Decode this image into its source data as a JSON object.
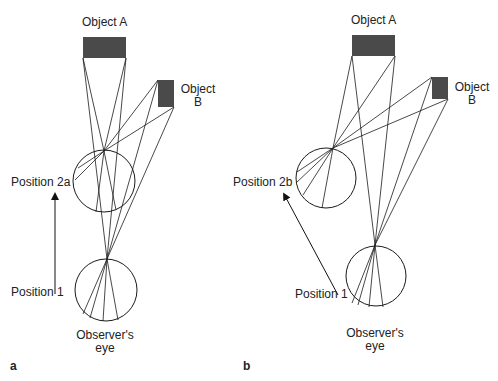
{
  "panels": [
    {
      "id": "a",
      "letter": "a",
      "object_a": {
        "label": "Object A",
        "rect": [
          83,
          37,
          43,
          21
        ]
      },
      "object_b": {
        "label_line1": "Object",
        "label_line2": "B",
        "rect": [
          158,
          80,
          16,
          27
        ]
      },
      "position2": {
        "label": "Position 2a",
        "center": [
          104,
          181
        ],
        "r": 31,
        "focus": [
          104,
          151
        ]
      },
      "position1": {
        "label": "Position 1",
        "center": [
          106,
          290
        ],
        "r": 31,
        "focus": [
          107,
          259
        ]
      },
      "eye_label_line1": "Observer's",
      "eye_label_line2": "eye",
      "arrow": {
        "from": [
          55,
          294
        ],
        "to": [
          55,
          196
        ]
      },
      "rays_pos2": [
        [
          [
            83,
            58
          ],
          [
            104,
            151
          ],
          [
            96,
            212
          ]
        ],
        [
          [
            126,
            58
          ],
          [
            104,
            151
          ],
          [
            116,
            210
          ]
        ],
        [
          [
            158,
            80
          ],
          [
            104,
            151
          ],
          [
            75,
            180
          ]
        ],
        [
          [
            174,
            107
          ],
          [
            104,
            151
          ],
          [
            78,
            168
          ]
        ]
      ],
      "rays_pos1": [
        [
          [
            158,
            80
          ],
          [
            107,
            259
          ],
          [
            90,
            318
          ]
        ],
        [
          [
            174,
            107
          ],
          [
            107,
            259
          ],
          [
            83,
            314
          ]
        ],
        [
          [
            83,
            58
          ],
          [
            107,
            259
          ],
          [
            118,
            320
          ]
        ],
        [
          [
            126,
            58
          ],
          [
            107,
            259
          ],
          [
            103,
            321
          ]
        ]
      ]
    },
    {
      "id": "b",
      "letter": "b",
      "object_a": {
        "label": "Object A",
        "rect": [
          352,
          35,
          43,
          21
        ]
      },
      "object_b": {
        "label_line1": "Object",
        "label_line2": "B",
        "rect": [
          432,
          77,
          16,
          22
        ]
      },
      "position2": {
        "label": "Position 2b",
        "center": [
          326,
          178
        ],
        "r": 30,
        "focus": [
          333,
          148
        ]
      },
      "position1": {
        "label": "Position 1",
        "center": [
          376,
          276
        ],
        "r": 30,
        "focus": [
          375,
          245
        ]
      },
      "eye_label_line1": "Observer's",
      "eye_label_line2": "eye",
      "arrow": {
        "from": [
          338,
          295
        ],
        "to": [
          285,
          196
        ]
      },
      "rays_pos2": [
        [
          [
            352,
            56
          ],
          [
            333,
            148
          ],
          [
            322,
            208
          ]
        ],
        [
          [
            395,
            56
          ],
          [
            333,
            148
          ],
          [
            303,
            195
          ]
        ],
        [
          [
            432,
            77
          ],
          [
            333,
            148
          ],
          [
            297,
            172
          ]
        ],
        [
          [
            448,
            99
          ],
          [
            333,
            148
          ],
          [
            296,
            183
          ]
        ]
      ],
      "rays_pos1": [
        [
          [
            352,
            56
          ],
          [
            375,
            245
          ],
          [
            383,
            307
          ]
        ],
        [
          [
            395,
            56
          ],
          [
            375,
            245
          ],
          [
            369,
            307
          ]
        ],
        [
          [
            432,
            77
          ],
          [
            375,
            245
          ],
          [
            352,
            303
          ]
        ],
        [
          [
            448,
            99
          ],
          [
            375,
            245
          ],
          [
            358,
            305
          ]
        ]
      ]
    }
  ],
  "colors": {
    "object_fill": "#4a4a4a",
    "line": "#1a1a1a"
  }
}
